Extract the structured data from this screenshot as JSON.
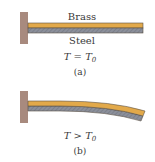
{
  "figure": {
    "panel_a": {
      "top_label": "Brass",
      "bottom_label": "Steel",
      "condition": {
        "var": "T",
        "op": "=",
        "rhs": "T",
        "rhs_sub": "0"
      },
      "caption": "(a)"
    },
    "panel_b": {
      "condition": {
        "var": "T",
        "op": ">",
        "rhs": "T",
        "rhs_sub": "0"
      },
      "caption": "(b)"
    },
    "colors": {
      "wall": "#a88a7e",
      "brass": "#e2a94a",
      "steel": "#8b8f9a",
      "outline": "#5a5044"
    }
  }
}
